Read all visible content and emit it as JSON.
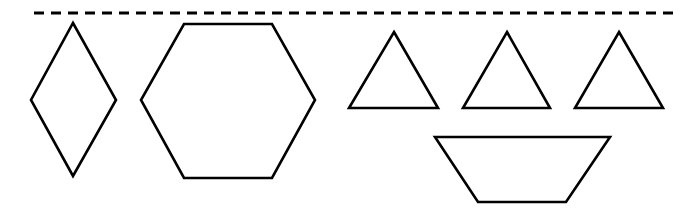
{
  "figure": {
    "width": 700,
    "height": 222,
    "background": "#ffffff",
    "stroke_color": "#000000",
    "dashed_line": {
      "x1": 34,
      "y1": 13,
      "x2": 680,
      "y2": 13
    },
    "shapes": [
      {
        "id": "rhombus",
        "type": "rhombus",
        "points": "73,23 116,100 73,176 31,100"
      },
      {
        "id": "hexagon",
        "type": "hexagon",
        "points": "184,24 272,24 315,100 272,178 184,178 141,100"
      },
      {
        "id": "triangle-1",
        "type": "triangle",
        "points": "394,32 438,108 349,108"
      },
      {
        "id": "triangle-2",
        "type": "triangle",
        "points": "507,32 550,108 463,108"
      },
      {
        "id": "triangle-3",
        "type": "triangle",
        "points": "619,32 663,108 575,108"
      },
      {
        "id": "trapezoid",
        "type": "trapezoid",
        "points": "435,137 610,137 566,202 478,202"
      }
    ]
  }
}
